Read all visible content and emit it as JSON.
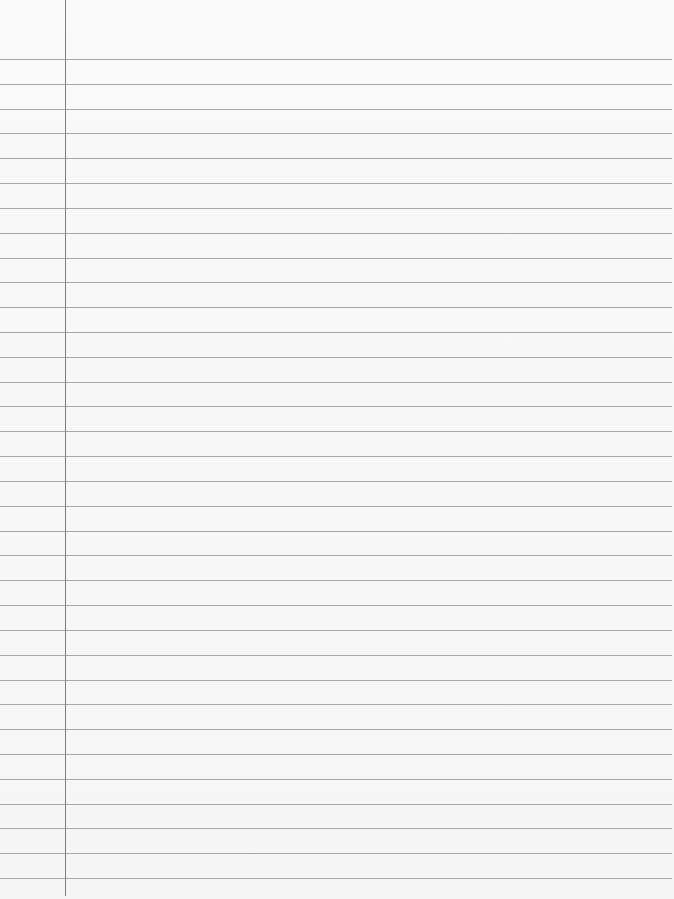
{
  "paper": {
    "type": "lined-notebook-paper",
    "background_color": "#f7f7f7",
    "rule_color": "#a9a9a9",
    "margin_line_color": "#7e7e7e",
    "margin_line_x": 65,
    "first_rule_y": 59,
    "rule_spacing": 24.82,
    "rule_count": 34,
    "content": ""
  }
}
